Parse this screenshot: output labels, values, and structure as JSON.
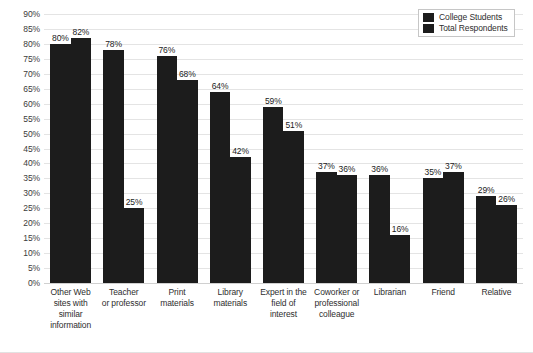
{
  "chart_data": {
    "type": "bar",
    "title": "",
    "subtitle": "",
    "xlabel": "",
    "ylabel": "",
    "ylim": [
      0,
      90
    ],
    "ytick_step": 5,
    "grid": true,
    "legend_position": "top-right",
    "categories": [
      "Other Web sites with similar information",
      "Teacher or professor",
      "Print materials",
      "Library materials",
      "Expert in the field of interest",
      "Coworker or professional colleague",
      "Librarian",
      "Friend",
      "Relative"
    ],
    "category_lines": [
      [
        "Other Web",
        "sites with",
        "similar",
        "information"
      ],
      [
        "Teacher",
        "or professor"
      ],
      [
        "Print",
        "materials"
      ],
      [
        "Library",
        "materials"
      ],
      [
        "Expert in the",
        "field of",
        "interest"
      ],
      [
        "Coworker or",
        "professional",
        "colleague"
      ],
      [
        "Librarian"
      ],
      [
        "Friend"
      ],
      [
        "Relative"
      ]
    ],
    "ytick_labels": [
      "90%",
      "85%",
      "80%",
      "75%",
      "70%",
      "65%",
      "60%",
      "55%",
      "50%",
      "45%",
      "40%",
      "35%",
      "30%",
      "25%",
      "20%",
      "15%",
      "10%",
      "5%",
      "0%"
    ],
    "ytick_values": [
      90,
      85,
      80,
      75,
      70,
      65,
      60,
      55,
      50,
      45,
      40,
      35,
      30,
      25,
      20,
      15,
      10,
      5,
      0
    ],
    "series": [
      {
        "name": "College Students",
        "color": "#1c1c1c",
        "values": [
          80,
          78,
          76,
          64,
          59,
          37,
          36,
          35,
          29
        ],
        "labels": [
          "80%",
          "78%",
          "76%",
          "64%",
          "59%",
          "37%",
          "36%",
          "35%",
          "29%"
        ]
      },
      {
        "name": "Total Respondents",
        "color": "#1c1c1c",
        "values": [
          82,
          25,
          68,
          42,
          51,
          36,
          16,
          37,
          26
        ],
        "labels": [
          "82%",
          "25%",
          "68%",
          "42%",
          "51%",
          "36%",
          "16%",
          "37%",
          "26%"
        ]
      }
    ]
  },
  "legend": {
    "items": [
      {
        "label": "College Students",
        "color": "#1c1c1c"
      },
      {
        "label": "Total Respondents",
        "color": "#1c1c1c"
      }
    ]
  }
}
